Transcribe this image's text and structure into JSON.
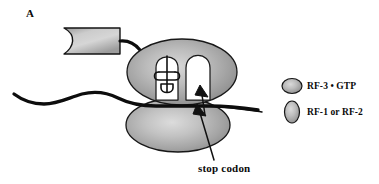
{
  "figure": {
    "panel_label": "A",
    "background_color": "#ffffff",
    "ink_color": "#0a0a0a"
  },
  "colors": {
    "subunit_fill_light": "#cfcfcf",
    "subunit_fill_mid": "#a8a8a8",
    "subunit_fill_dark": "#8a8a8a",
    "outline": "#1a1a1a",
    "cavity_fill": "#ffffff",
    "polypeptide_box_light": "#d4d4d4",
    "polypeptide_box_dark": "#8f8f8f",
    "mrna_stroke": "#0d0d0d"
  },
  "annotations": {
    "stop_codon": {
      "label": "stop codon",
      "x": 198,
      "y": 172
    }
  },
  "legend": {
    "items": [
      {
        "label": "RF-3 • GTP",
        "marker_shape": "horizontal-ellipse",
        "marker_rx": 10,
        "marker_ry": 7.5,
        "marker_cx": 292,
        "marker_cy": 86,
        "label_x": 307,
        "label_y": 89
      },
      {
        "label": "RF-1 or RF-2",
        "marker_shape": "vertical-ellipse",
        "marker_rx": 7.5,
        "marker_ry": 11,
        "marker_cx": 292,
        "marker_cy": 112,
        "label_x": 307,
        "label_y": 115
      }
    ]
  },
  "structures": {
    "large_subunit": {
      "name": "50S large ribosomal subunit",
      "cx": 182,
      "cy": 72,
      "rx": 55,
      "ry": 33
    },
    "small_subunit": {
      "name": "30S small ribosomal subunit",
      "cx": 178,
      "cy": 125,
      "rx": 52,
      "ry": 27
    },
    "p_site": {
      "name": "P site tunnel with tRNA",
      "contains_trna": true
    },
    "a_site": {
      "name": "A site tunnel, vacant",
      "contains_trna": false
    },
    "nascent_polypeptide_box": {
      "name": "nascent polypeptide",
      "x": 64,
      "y": 28,
      "width": 56,
      "height": 26
    },
    "mrna": {
      "name": "messenger RNA strand"
    }
  }
}
